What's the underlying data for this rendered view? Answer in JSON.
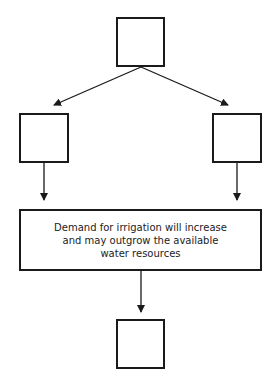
{
  "diagram": {
    "type": "flowchart",
    "nodes": [
      {
        "id": "top",
        "label": ""
      },
      {
        "id": "left",
        "label": ""
      },
      {
        "id": "right",
        "label": ""
      },
      {
        "id": "center",
        "lines": [
          "Demand for irrigation will increase",
          "and may outgrow the available",
          "water resources"
        ]
      },
      {
        "id": "bottom",
        "label": ""
      }
    ],
    "edges": [
      {
        "from": "top",
        "to": "left"
      },
      {
        "from": "top",
        "to": "right"
      },
      {
        "from": "left",
        "to": "center"
      },
      {
        "from": "right",
        "to": "center"
      },
      {
        "from": "center",
        "to": "bottom"
      }
    ],
    "colors": {
      "stroke": "#1a1a1a",
      "background": "#ffffff"
    }
  }
}
